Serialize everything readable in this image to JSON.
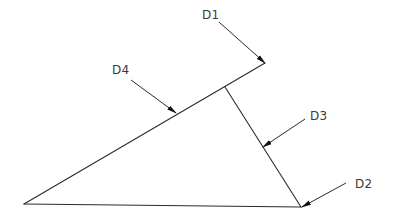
{
  "diagram": {
    "type": "technical-line-drawing",
    "colors": {
      "line": "#2b2b2b",
      "text": "#3a3a3a",
      "background": "#ffffff"
    },
    "labels": [
      {
        "id": "D1",
        "text": "D1"
      },
      {
        "id": "D2",
        "text": "D2"
      },
      {
        "id": "D3",
        "text": "D3"
      },
      {
        "id": "D4",
        "text": "D4"
      }
    ],
    "geometry": {
      "left_vertex": [
        24,
        204
      ],
      "top_vertex": [
        265,
        63
      ],
      "bottom_right_vertex": [
        301,
        207
      ],
      "junction_point": [
        225,
        87
      ]
    }
  }
}
